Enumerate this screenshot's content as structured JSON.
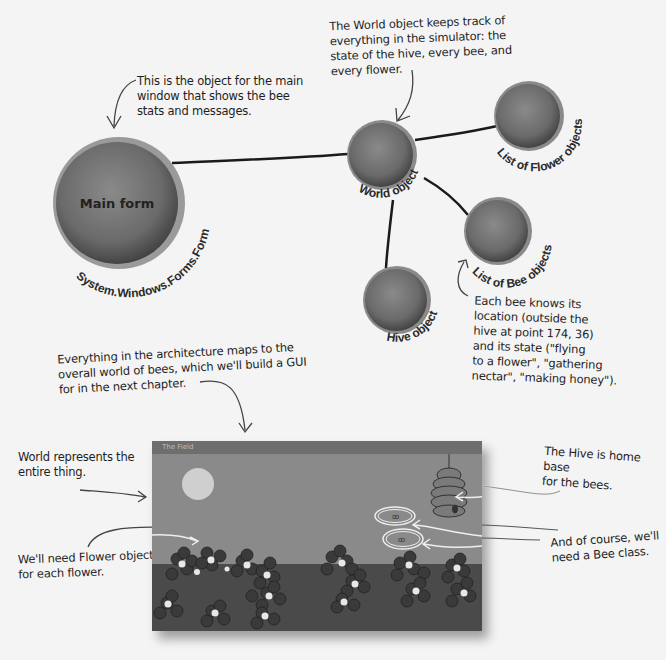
{
  "notes": {
    "world_object_note": [
      "The World object keeps track of",
      "everything in the simulator: the",
      "state of the hive, every bee, and",
      "every flower."
    ],
    "main_form_note": [
      "This is the object for the main",
      "window that shows the bee",
      "stats and messages."
    ],
    "bee_location_note": [
      "Each bee knows its",
      "location (outside the",
      "hive at point 174, 36)",
      "and its state (\"flying",
      "to a flower\", \"gathering",
      "nectar\", \"making honey\")."
    ],
    "architecture_note": [
      "Everything in the architecture maps to the",
      "overall world of bees, which we'll build a GUI",
      "for in the next chapter."
    ],
    "world_represents_note": [
      "World represents the",
      "entire thing."
    ],
    "flower_objects_note": [
      "We'll need Flower objects",
      "for each flower."
    ],
    "hive_note": [
      "The Hive is home base",
      "for the bees."
    ],
    "bee_class_note": [
      "And of course, we'll",
      "need a Bee class."
    ]
  },
  "nodes": {
    "main_form": {
      "inner": "Main form",
      "label": "System.Windows.Forms.Form"
    },
    "world": {
      "label": "World object"
    },
    "flowers": {
      "label": "List of Flower objects"
    },
    "bees": {
      "label": "List of Bee objects"
    },
    "hive": {
      "label": "Hive object"
    }
  },
  "field_window": {
    "title": "The Field"
  },
  "colors": {
    "node_fill": "#6a6a6a",
    "node_rim": "#8c8c8c",
    "sky": "#8a8a8a",
    "ground": "#4a4a4a"
  }
}
